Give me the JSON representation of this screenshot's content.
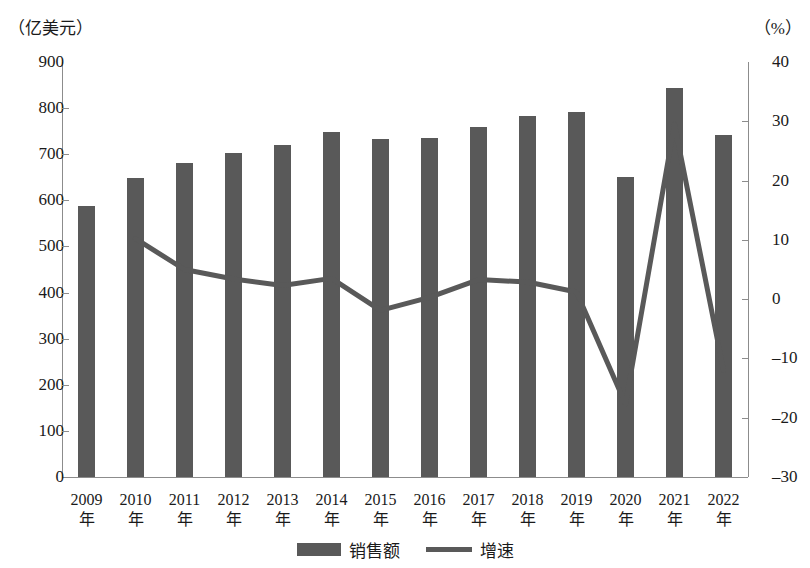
{
  "axes": {
    "left_unit": "（亿美元）",
    "right_unit": "（%）",
    "left_ticks": [
      "900",
      "800",
      "700",
      "600",
      "500",
      "400",
      "300",
      "200",
      "100",
      "0"
    ],
    "right_ticks": [
      "40",
      "30",
      "20",
      "10",
      "0",
      "-10",
      "-20",
      "-30"
    ]
  },
  "legend": {
    "bar_label": "销售额",
    "line_label": "增速"
  },
  "x_suffix": "年",
  "colors": {
    "bar": "#595959",
    "line": "#595959",
    "axis": "#8c8c8c",
    "text": "#1a1a1a"
  },
  "chart_data": {
    "type": "bar",
    "title": "",
    "xlabel": "",
    "ylabel": "（亿美元）",
    "y2label": "（%）",
    "grid": false,
    "legend_position": "bottom",
    "categories": [
      "2009年",
      "2010年",
      "2011年",
      "2012年",
      "2013年",
      "2014年",
      "2015年",
      "2016年",
      "2017年",
      "2018年",
      "2019年",
      "2020年",
      "2021年",
      "2022年"
    ],
    "x_years": [
      "2009",
      "2010",
      "2011",
      "2012",
      "2013",
      "2014",
      "2015",
      "2016",
      "2017",
      "2018",
      "2019",
      "2020",
      "2021",
      "2022"
    ],
    "ylim": [
      0,
      900
    ],
    "y2lim": [
      -30,
      40
    ],
    "yticks": [
      0,
      100,
      200,
      300,
      400,
      500,
      600,
      700,
      800,
      900
    ],
    "y2ticks": [
      -30,
      -20,
      -10,
      0,
      10,
      20,
      30,
      40
    ],
    "series": [
      {
        "name": "销售额",
        "type": "bar",
        "axis": "left",
        "unit": "亿美元",
        "values": [
          588,
          648,
          680,
          703,
          719,
          748,
          734,
          736,
          760,
          782,
          791,
          651,
          843,
          741
        ]
      },
      {
        "name": "增速",
        "type": "line",
        "axis": "right",
        "unit": "%",
        "values": [
          null,
          10.2,
          5.0,
          3.4,
          2.3,
          3.5,
          -1.9,
          0.3,
          3.3,
          2.9,
          1.2,
          -17.7,
          29.5,
          -12.0
        ]
      }
    ]
  }
}
